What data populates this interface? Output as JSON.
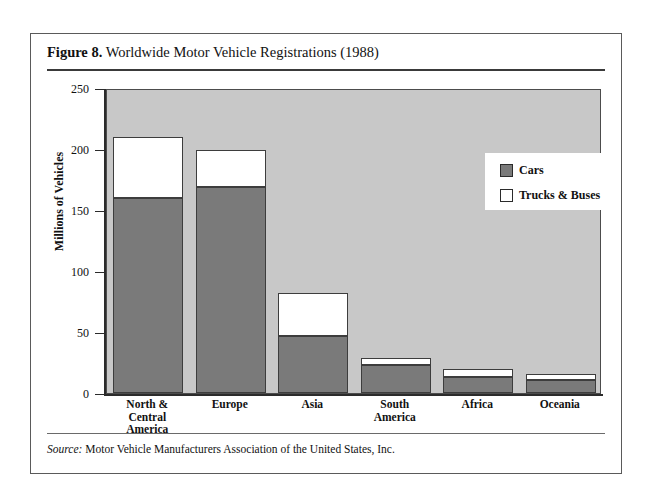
{
  "figure": {
    "caption_label": "Figure 8.",
    "caption_text": "Worldwide Motor Vehicle Registrations (1988)",
    "source_label": "Source:",
    "source_text": "Motor Vehicle Manufacturers Association of the United States, Inc."
  },
  "legend": {
    "items": [
      {
        "label": "Cars",
        "color": "#7a7a7a"
      },
      {
        "label": "Trucks & Buses",
        "color": "#ffffff"
      }
    ]
  },
  "colors": {
    "plot_background": "#c8c8c8",
    "cars": "#7a7a7a",
    "trucks": "#ffffff",
    "axis": "#2b2b2b",
    "frame": "#5a5a5a"
  },
  "chart_data": {
    "type": "bar",
    "stacked": true,
    "title": "Worldwide Motor Vehicle Registrations (1988)",
    "xlabel": "",
    "ylabel": "Millions of Vehicles",
    "ylim": [
      0,
      250
    ],
    "yticks": [
      0,
      50,
      100,
      150,
      200,
      250
    ],
    "grid": false,
    "legend_position": "upper-right",
    "categories": [
      "North &\nCentral\nAmerica",
      "Europe",
      "Asia",
      "South\nAmerica",
      "Africa",
      "Oceania"
    ],
    "category_labels": [
      [
        "North &",
        "Central",
        "America"
      ],
      [
        "Europe"
      ],
      [
        "Asia"
      ],
      [
        "South",
        "America"
      ],
      [
        "Africa"
      ],
      [
        "Oceania"
      ]
    ],
    "series": [
      {
        "name": "Cars",
        "values": [
          160,
          169,
          47,
          23,
          13,
          11
        ]
      },
      {
        "name": "Trucks & Buses",
        "values": [
          50,
          30,
          35,
          6,
          7,
          5
        ]
      }
    ],
    "totals": [
      210,
      199,
      82,
      29,
      20,
      16
    ]
  }
}
